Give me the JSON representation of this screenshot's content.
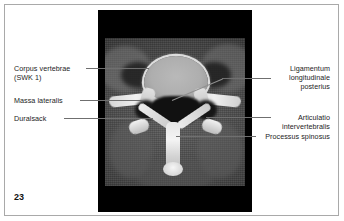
{
  "figure": {
    "number": "23",
    "modality_panel": "axial-ct-cervical-spine"
  },
  "labels_left": [
    {
      "id": "corpus-vertebrae",
      "line1": "Corpus vertebrae",
      "line2": "(SWK 1)"
    },
    {
      "id": "massa-lateralis",
      "line1": "Massa lateralis",
      "line2": ""
    },
    {
      "id": "duralsack",
      "line1": "Duralsack",
      "line2": ""
    }
  ],
  "labels_right": [
    {
      "id": "ligamentum-longitudinale-posterius",
      "line1": "Ligamentum",
      "line2": "longitudinale",
      "line3": "posterius"
    },
    {
      "id": "articulatio-intervertebralis",
      "line1": "Articulatio",
      "line2": "intervertebralis",
      "line3": ""
    },
    {
      "id": "processus-spinosus",
      "line1": "Processus spinosus",
      "line2": "",
      "line3": ""
    }
  ],
  "colors": {
    "page_background": "#ffffff",
    "page_border": "#a9a9a9",
    "panel_background": "#000000",
    "label_text": "#1c1c1c",
    "leader_line": "#6f6f6f"
  }
}
